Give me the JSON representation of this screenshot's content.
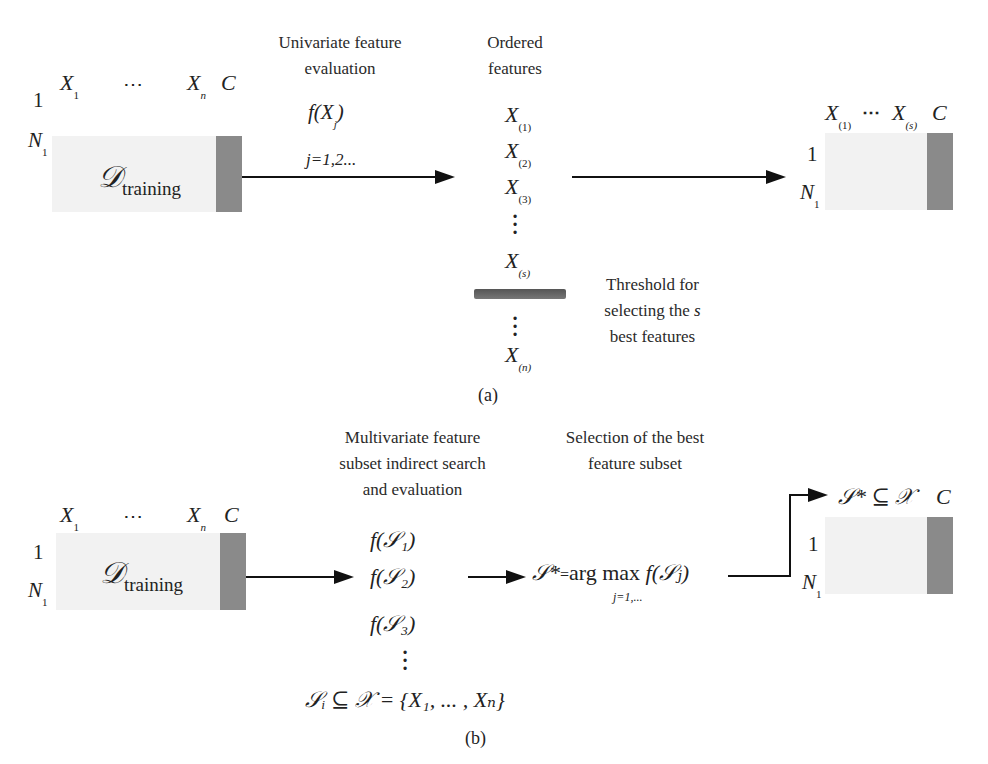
{
  "panel_a": {
    "caption": "(a)",
    "input_table": {
      "col_first": "X",
      "col_first_sub": "1",
      "col_dots": "⋯",
      "col_last": "X",
      "col_last_sub": "n",
      "class_label": "C",
      "row_first": "1",
      "row_last": "N",
      "row_last_sub": "1",
      "name_main": "𝒟",
      "name_sub": "training"
    },
    "step1": {
      "title_line1": "Univariate feature",
      "title_line2": "evaluation",
      "formula_f": "f(X",
      "formula_sub": "j",
      "formula_close": ")",
      "index": "j=1,2..."
    },
    "ordered": {
      "title_line1": "Ordered",
      "title_line2": "features",
      "items": [
        {
          "var": "X",
          "sub": "(1)"
        },
        {
          "var": "X",
          "sub": "(2)"
        },
        {
          "var": "X",
          "sub": "(3)"
        },
        {
          "var": "X",
          "sub": "(s)"
        },
        {
          "var": "X",
          "sub": "(n)"
        }
      ],
      "threshold_line1": "Threshold for",
      "threshold_line2": "selecting the",
      "threshold_var": "s",
      "threshold_line3": "best features"
    },
    "output_table": {
      "col_first": "X",
      "col_first_sub": "(1)",
      "col_dots": "⋯",
      "col_last": "X",
      "col_last_sub": "(s)",
      "class_label": "C",
      "row_first": "1",
      "row_last": "N",
      "row_last_sub": "1"
    }
  },
  "panel_b": {
    "caption": "(b)",
    "input_table": {
      "col_first": "X",
      "col_first_sub": "1",
      "col_dots": "⋯",
      "col_last": "X",
      "col_last_sub": "n",
      "class_label": "C",
      "row_first": "1",
      "row_last": "N",
      "row_last_sub": "1",
      "name_main": "𝒟",
      "name_sub": "training"
    },
    "step1": {
      "title_line1": "Multivariate feature",
      "title_line2": "subset indirect search",
      "title_line3": "and evaluation",
      "items": [
        "f(𝒮₁)",
        "f(𝒮₂)",
        "f(𝒮₃)"
      ],
      "subset_def": "𝒮ᵢ ⊆ 𝒳 = {X₁, ... , Xₙ}"
    },
    "step2": {
      "title_line1": "Selection of the best",
      "title_line2": "feature subset",
      "formula_left": "𝒮*",
      "formula_eq": "=",
      "formula_op": "arg max",
      "formula_right": "f(𝒮ⱼ)",
      "formula_under": "j=1,..."
    },
    "output_table": {
      "header": "𝒮* ⊆ 𝒳",
      "class_label": "C",
      "row_first": "1",
      "row_last": "N",
      "row_last_sub": "1"
    }
  },
  "colors": {
    "table_fill": "#f2f2f2",
    "class_column": "#8a8a8a",
    "arrow": "#111111",
    "threshold_bar": "#666666"
  }
}
